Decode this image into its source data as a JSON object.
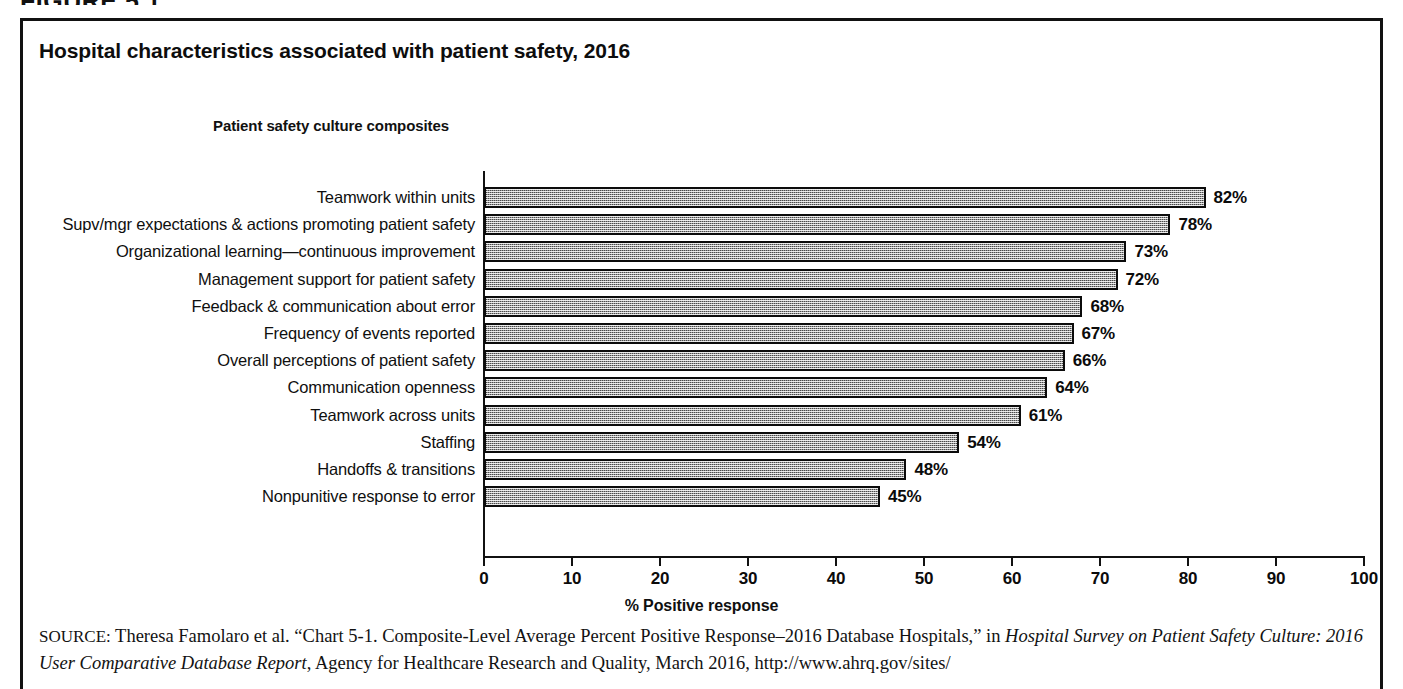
{
  "document": {
    "figure_head": "FIGURE 5.1"
  },
  "figure": {
    "title": "Hospital characteristics associated with patient safety, 2016"
  },
  "chart_data": {
    "type": "bar",
    "orientation": "horizontal",
    "title": "Hospital characteristics associated with patient safety, 2016",
    "subtitle": "Patient safety culture composites",
    "xlabel": "% Positive response",
    "ylabel": "",
    "xlim": [
      0,
      100
    ],
    "grid": false,
    "legend": "none",
    "bar_fill": "#9c9c9c",
    "bar_outline": "#0b0b0b",
    "xticks": [
      "0",
      "10",
      "20",
      "30",
      "40",
      "50",
      "60",
      "70",
      "80",
      "90",
      "100"
    ],
    "xtick_values": [
      0,
      10,
      20,
      30,
      40,
      50,
      60,
      70,
      80,
      90,
      100
    ],
    "categories": [
      "Teamwork within units",
      "Supv/mgr expectations & actions promoting patient safety",
      "Organizational learning—continuous improvement",
      "Management support for patient safety",
      "Feedback & communication about error",
      "Frequency of events reported",
      "Overall perceptions of patient safety",
      "Communication openness",
      "Teamwork across units",
      "Staffing",
      "Handoffs & transitions",
      "Nonpunitive response to error"
    ],
    "values": [
      82,
      78,
      73,
      72,
      68,
      67,
      66,
      64,
      61,
      54,
      48,
      45
    ],
    "value_labels": [
      "82%",
      "78%",
      "73%",
      "72%",
      "68%",
      "67%",
      "66%",
      "64%",
      "61%",
      "54%",
      "48%",
      "45%"
    ]
  },
  "source": {
    "label": "SOURCE:",
    "line1_a": " Theresa Famolaro et al. “Chart 5-1. Composite-Level Average Percent Positive Response–2016 Database Hospitals,” in ",
    "line1_italic": "Hospital Survey on",
    "line2_italic": "Patient Safety Culture: 2016 User Comparative Database Report",
    "line2_b": ", Agency for Healthcare Research and Quality, March 2016, http://www.ahrq.gov/sites/"
  }
}
